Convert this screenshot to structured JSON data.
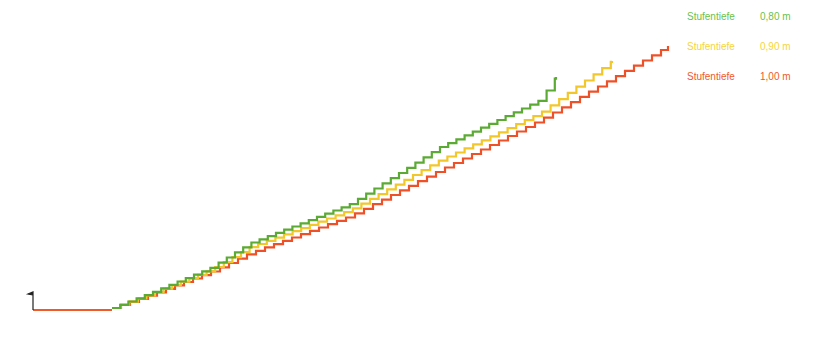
{
  "legend": {
    "items": [
      {
        "label": "Stufentiefe",
        "value": "0,80 m",
        "color": "#6cbf4a"
      },
      {
        "label": "Stufentiefe",
        "value": "0,90 m",
        "color": "#f5d53a"
      },
      {
        "label": "Stufentiefe",
        "value": "1,00 m",
        "color": "#ee5a2a"
      }
    ]
  },
  "diagram": {
    "start_marker": {
      "x": 33,
      "y": 310,
      "flag_top": 292
    },
    "base_line": {
      "x1": 33,
      "x2": 112,
      "y": 310,
      "color": "#ee5a2a"
    },
    "stairs": [
      {
        "name": "Stufentiefe 0,80 m",
        "color": "#5aaa33",
        "step_w": 8.2,
        "points": [
          [
            112,
            308
          ],
          [
            150,
            293
          ],
          [
            210,
            268
          ],
          [
            250,
            243
          ],
          [
            350,
            204
          ],
          [
            440,
            147
          ],
          [
            540,
            100
          ],
          [
            556,
            77
          ]
        ]
      },
      {
        "name": "Stufentiefe 0,90 m",
        "color": "#f2c72a",
        "step_w": 8.6,
        "points": [
          [
            112,
            308
          ],
          [
            150,
            294
          ],
          [
            210,
            270
          ],
          [
            250,
            247
          ],
          [
            350,
            210
          ],
          [
            440,
            160
          ],
          [
            540,
            113
          ],
          [
            612,
            61
          ]
        ]
      },
      {
        "name": "Stufentiefe 1,00 m",
        "color": "#ee5128",
        "step_w": 9.0,
        "points": [
          [
            112,
            308
          ],
          [
            150,
            295
          ],
          [
            210,
            272
          ],
          [
            250,
            253
          ],
          [
            350,
            216
          ],
          [
            440,
            170
          ],
          [
            540,
            120
          ],
          [
            668,
            46
          ]
        ]
      }
    ]
  }
}
